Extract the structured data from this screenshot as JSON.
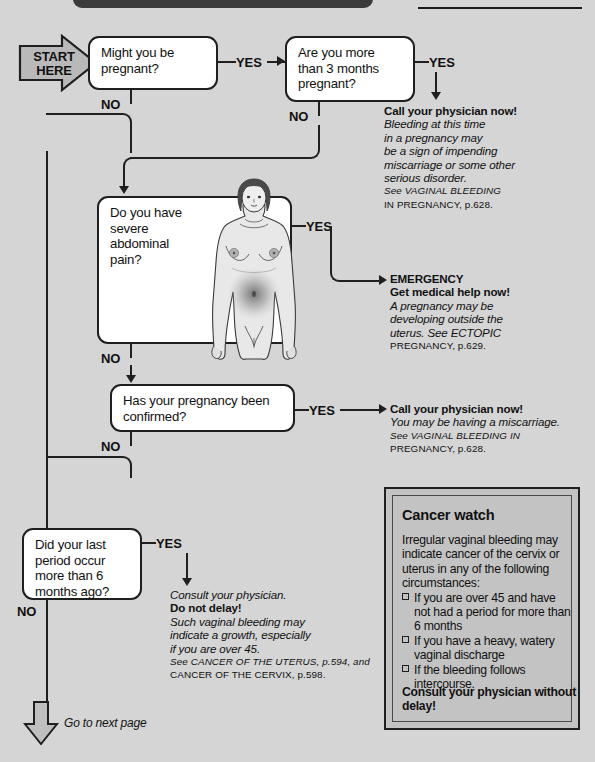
{
  "meta": {
    "background_color": "#d5d5d5",
    "box_fill": "#ffffff",
    "ink": "#1f1f1f",
    "panel_fill": "#c3c3c3"
  },
  "start": {
    "line1": "START",
    "line2": "HERE"
  },
  "questions": [
    {
      "id": "q1",
      "text": "Might you be\npregnant?",
      "yes_label": "YES",
      "no_label": "NO"
    },
    {
      "id": "q2",
      "text": "Are you more\nthan 3 months\npregnant?",
      "yes_label": "YES",
      "no_label": "NO"
    },
    {
      "id": "q3",
      "text": "Do you have\nsevere\nabdominal\npain?",
      "yes_label": "YES",
      "no_label": "NO"
    },
    {
      "id": "q4",
      "text": "Has your pregnancy been\nconfirmed?",
      "yes_label": "YES",
      "no_label": "NO"
    },
    {
      "id": "q5",
      "text": "Did your last\nperiod occur\nmore than 6\nmonths ago?",
      "yes_label": "YES",
      "no_label": "NO"
    }
  ],
  "advice": {
    "a1": {
      "lines": [
        {
          "t": "Call your physician now!",
          "s": "b"
        },
        {
          "t": "Bleeding at this time",
          "s": "i"
        },
        {
          "t": "in a pregnancy may",
          "s": "i"
        },
        {
          "t": "be a sign of impending",
          "s": "i"
        },
        {
          "t": "miscarriage or some other",
          "s": "i"
        },
        {
          "t": "serious disorder.",
          "s": "i"
        },
        {
          "t": "See VAGINAL BLEEDING",
          "s": "see"
        },
        {
          "t": "IN PREGNANCY, p.628.",
          "s": "sc"
        }
      ]
    },
    "a2": {
      "lines": [
        {
          "t": "EMERGENCY",
          "s": "b"
        },
        {
          "t": "Get medical help now!",
          "s": "b"
        },
        {
          "t": "A pregnancy may be",
          "s": "i"
        },
        {
          "t": "developing outside the",
          "s": "i"
        },
        {
          "t": "uterus. See ECTOPIC",
          "s": "mix"
        },
        {
          "t": "PREGNANCY, p.629.",
          "s": "sc"
        }
      ]
    },
    "a3": {
      "lines": [
        {
          "t": "Call your physician now!",
          "s": "b"
        },
        {
          "t": "You may be having a miscarriage.",
          "s": "i"
        },
        {
          "t": "See VAGINAL BLEEDING IN",
          "s": "see"
        },
        {
          "t": "PREGNANCY, p.628.",
          "s": "sc"
        }
      ]
    },
    "a4": {
      "lines": [
        {
          "t": "Consult your physician.",
          "s": "i"
        },
        {
          "t": "Do not delay!",
          "s": "b"
        },
        {
          "t": "Such vaginal bleeding may",
          "s": "i"
        },
        {
          "t": "indicate a growth, especially",
          "s": "i"
        },
        {
          "t": "if you are over 45.",
          "s": "i"
        },
        {
          "t": "See CANCER OF THE UTERUS, p.594, and",
          "s": "see2"
        },
        {
          "t": "CANCER OF THE CERVIX, p.598.",
          "s": "sc"
        }
      ]
    }
  },
  "cancer_watch": {
    "title": "Cancer watch",
    "intro": "Irregular vaginal bleeding may indicate cancer of the cervix or uterus in any of the following circumstances:",
    "items": [
      "If you are over 45 and have not had a period for more than 6 months",
      "If you have a heavy, watery vaginal discharge",
      "If the bleeding follows intercourse."
    ],
    "footer": "Consult your physician without delay!"
  },
  "next_page": {
    "label": "Go to next page"
  }
}
